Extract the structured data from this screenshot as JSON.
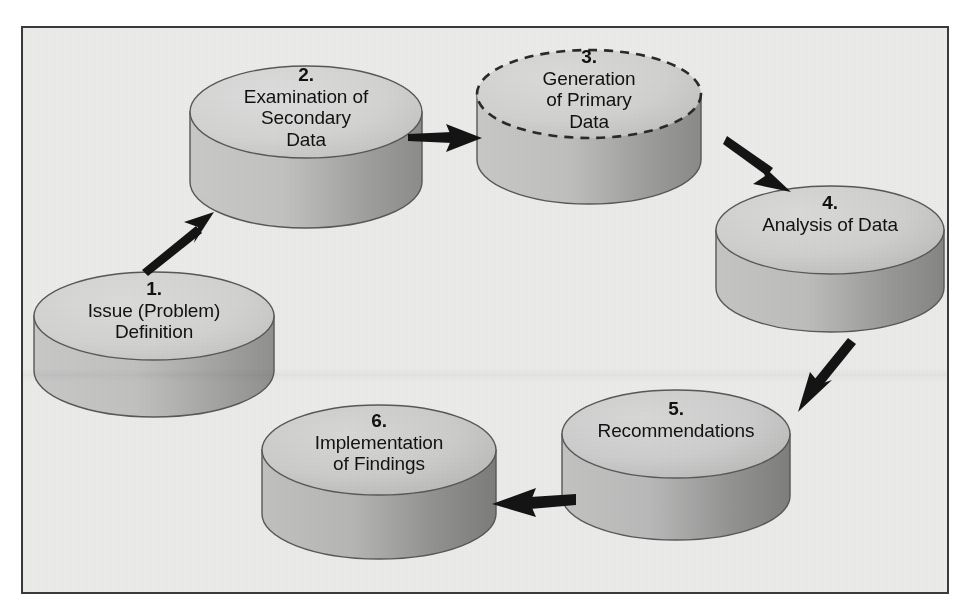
{
  "diagram": {
    "type": "cyclic-process-flow",
    "background_color": "#ececeb",
    "border_color": "#3a3a3a",
    "cylinder_top_color": "#d2d2d1",
    "cylinder_side_light": "#c6c6c5",
    "cylinder_side_dark": "#8e8e8d",
    "outline_color": "#555555",
    "arrow_color": "#1a1a1a",
    "text_color": "#121212",
    "steps": [
      {
        "number": "1.",
        "label": "Issue (Problem)\nDefinition",
        "line1": "Issue (Problem)",
        "line2": "Definition",
        "outline_style": "solid"
      },
      {
        "number": "2.",
        "label": "Examination of\nSecondary\nData",
        "line1": "Examination of",
        "line2": "Secondary",
        "line3": "Data",
        "outline_style": "solid"
      },
      {
        "number": "3.",
        "label": "Generation\nof Primary\nData",
        "line1": "Generation",
        "line2": "of Primary",
        "line3": "Data",
        "outline_style": "dashed"
      },
      {
        "number": "4.",
        "label": "Analysis of Data",
        "line1": "Analysis of Data",
        "outline_style": "solid"
      },
      {
        "number": "5.",
        "label": "Recommendations",
        "line1": "Recommendations",
        "outline_style": "solid"
      },
      {
        "number": "6.",
        "label": "Implementation\nof Findings",
        "line1": "Implementation",
        "line2": "of Findings",
        "outline_style": "solid"
      }
    ],
    "arrows": [
      {
        "name": "arrow-step1-to-step2",
        "from": "1",
        "to": "2",
        "direction": "up-right"
      },
      {
        "name": "arrow-step2-to-step3",
        "from": "2",
        "to": "3",
        "direction": "right"
      },
      {
        "name": "arrow-step3-to-step4",
        "from": "3",
        "to": "4",
        "direction": "down-right"
      },
      {
        "name": "arrow-step4-to-step5",
        "from": "4",
        "to": "5",
        "direction": "down-left"
      },
      {
        "name": "arrow-step5-to-step6",
        "from": "5",
        "to": "6",
        "direction": "left"
      }
    ]
  }
}
